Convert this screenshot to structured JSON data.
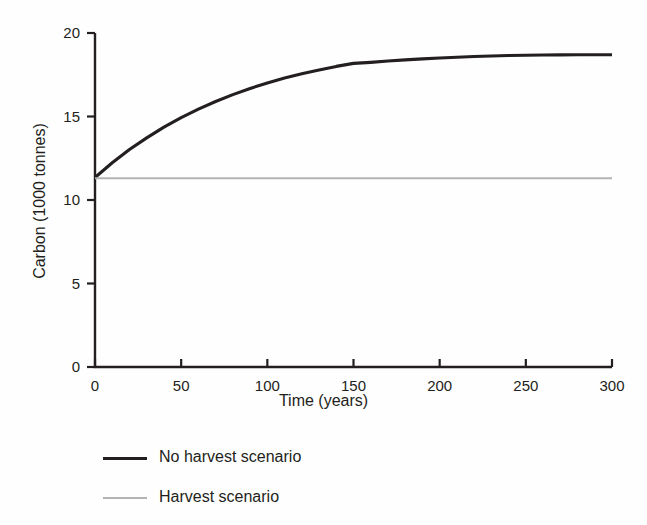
{
  "chart_data": {
    "type": "line",
    "title": "",
    "xlabel": "Time (years)",
    "ylabel": "Carbon (1000 tonnes)",
    "xlim": [
      0,
      300
    ],
    "ylim": [
      0,
      20
    ],
    "xticks": [
      0,
      50,
      100,
      150,
      200,
      250,
      300
    ],
    "yticks": [
      0,
      5,
      10,
      15,
      20
    ],
    "xtick_labels": [
      "0",
      "50",
      "100",
      "150",
      "200",
      "250",
      "300"
    ],
    "ytick_labels": [
      "0",
      "5",
      "10",
      "15",
      "20"
    ],
    "grid": false,
    "legend_position": "below-left",
    "x": [
      0,
      10,
      20,
      30,
      40,
      50,
      60,
      70,
      80,
      90,
      100,
      110,
      120,
      130,
      140,
      150,
      160,
      170,
      180,
      190,
      200,
      210,
      220,
      230,
      240,
      250,
      260,
      270,
      280,
      290,
      300
    ],
    "series": [
      {
        "name": "No harvest scenario",
        "color": "#231f20",
        "width": 3.1,
        "values": [
          11.35,
          12.23,
          13.02,
          13.72,
          14.36,
          14.93,
          15.44,
          15.9,
          16.31,
          16.68,
          17.01,
          17.3,
          17.56,
          17.79,
          18.0,
          18.18,
          18.24,
          18.32,
          18.39,
          18.45,
          18.5,
          18.55,
          18.59,
          18.62,
          18.65,
          18.67,
          18.68,
          18.69,
          18.7,
          18.7,
          18.7
        ]
      },
      {
        "name": "Harvest scenario",
        "color": "#b3b3b3",
        "width": 2.0,
        "values": [
          11.3,
          11.3,
          11.3,
          11.3,
          11.3,
          11.3,
          11.3,
          11.3,
          11.3,
          11.3,
          11.3,
          11.3,
          11.3,
          11.3,
          11.3,
          11.3,
          11.3,
          11.3,
          11.3,
          11.3,
          11.3,
          11.3,
          11.3,
          11.3,
          11.3,
          11.3,
          11.3,
          11.3,
          11.3,
          11.3,
          11.3
        ]
      }
    ]
  },
  "legend": {
    "items": [
      {
        "label": "No harvest scenario",
        "color": "#231f20",
        "thickness": "3px"
      },
      {
        "label": "Harvest scenario",
        "color": "#b3b3b3",
        "thickness": "2px"
      }
    ]
  },
  "axes": {
    "axis_color": "#231f20",
    "background": "#fefefe"
  }
}
